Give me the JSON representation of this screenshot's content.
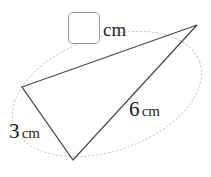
{
  "figure": {
    "type": "triangle-with-dotted-ellipse",
    "background_color": "#ffffff",
    "triangle": {
      "stroke_color": "#4a4a4a",
      "stroke_width": 1.3,
      "fill": "none",
      "vertices": [
        {
          "name": "left-vertex",
          "x": 22,
          "y": 87
        },
        {
          "name": "top-right-vertex",
          "x": 197,
          "y": 25
        },
        {
          "name": "bottom-vertex",
          "x": 73,
          "y": 160
        }
      ],
      "points_attr": "22,87 197,25 73,160"
    },
    "ellipse": {
      "stroke_color": "#c9c9c9",
      "stroke_width": 1,
      "dash_pattern": "1.5,2.5",
      "center_x": 107,
      "center_y": 94,
      "radius_x": 98,
      "radius_y": 57,
      "rotation_deg": -19,
      "transform_attr": "rotate(-19 107 94)"
    }
  },
  "answer_input": {
    "name": "missing-side-length",
    "value": "",
    "placeholder": "",
    "unit_label": "cm",
    "border_color": "#9a9a9a"
  },
  "labels": {
    "side_6": {
      "value": "6",
      "unit": "cm"
    },
    "side_3": {
      "value": "3",
      "unit": "cm"
    }
  }
}
